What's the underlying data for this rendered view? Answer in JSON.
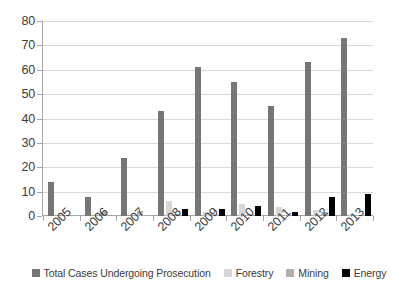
{
  "chart_data": {
    "type": "bar",
    "title": "",
    "subtitle": "",
    "xlabel": "",
    "ylabel": "",
    "categories": [
      "2005",
      "2006",
      "2007",
      "2008",
      "2009",
      "2010",
      "2011",
      "2012",
      "2013"
    ],
    "series": [
      {
        "name": "Total Cases Undergoing Prosecution",
        "color": "#767676",
        "values": [
          14,
          8,
          24,
          43,
          61,
          55,
          45,
          63,
          73
        ]
      },
      {
        "name": "Forestry",
        "color": "#d6d6d6",
        "values": [
          0,
          0,
          0,
          6,
          1.5,
          5,
          3.5,
          2.5,
          1
        ]
      },
      {
        "name": "Mining",
        "color": "#b2b2b2",
        "values": [
          0,
          1.5,
          2,
          1,
          1,
          1,
          0.5,
          1.5,
          0.5
        ]
      },
      {
        "name": "Energy",
        "color": "#000000",
        "values": [
          0,
          0,
          0,
          3,
          3,
          4,
          1.5,
          8,
          9
        ]
      }
    ],
    "ylim": [
      0,
      80
    ],
    "ytick_values": [
      0,
      10,
      20,
      30,
      40,
      50,
      60,
      70,
      80
    ],
    "ytick_labels": [
      "0",
      "10",
      "20",
      "30",
      "40",
      "50",
      "60",
      "70",
      "80"
    ],
    "grid": true,
    "legend_position": "bottom"
  },
  "legend": {
    "items": [
      {
        "label": "Total Cases Undergoing Prosecution",
        "color": "#767676"
      },
      {
        "label": "Forestry",
        "color": "#d6d6d6"
      },
      {
        "label": "Mining",
        "color": "#b2b2b2"
      },
      {
        "label": "Energy",
        "color": "#000000"
      }
    ]
  },
  "axes": {
    "y_labels": [
      "80",
      "70",
      "60",
      "50",
      "40",
      "30",
      "20",
      "10",
      "0"
    ],
    "x_labels": [
      "2005",
      "2006",
      "2007",
      "2008",
      "2009",
      "2010",
      "2011",
      "2012",
      "2013"
    ]
  }
}
